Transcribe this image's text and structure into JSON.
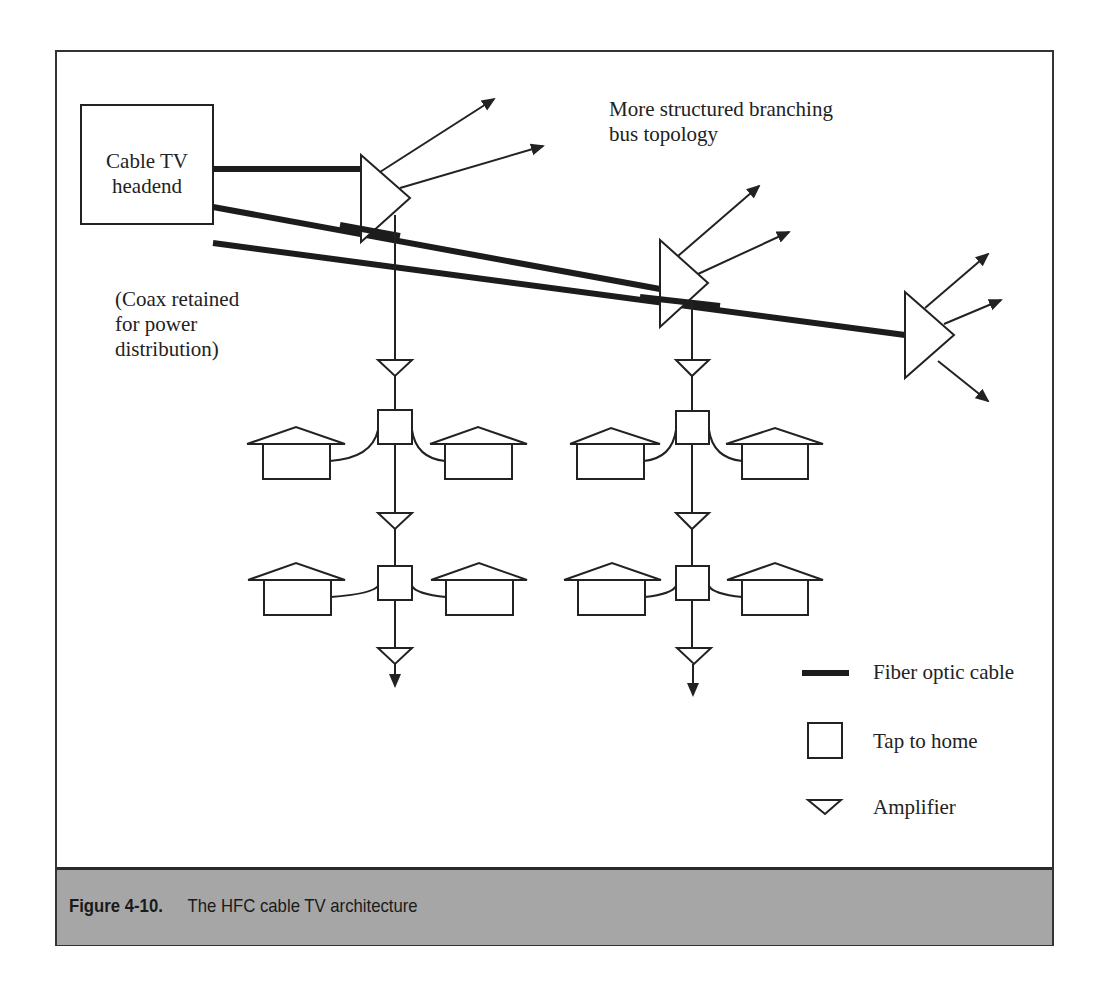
{
  "figure": {
    "caption_number": "Figure 4-10.",
    "caption_title": "The HFC cable TV architecture"
  },
  "labels": {
    "headend_line1": "Cable TV",
    "headend_line2": "headend",
    "coax_note_line1": "(Coax retained",
    "coax_note_line2": "for power",
    "coax_note_line3": "distribution)",
    "topology_line1": "More structured branching",
    "topology_line2": "bus topology"
  },
  "legend": {
    "items": [
      {
        "icon": "fiber-line-icon",
        "label": "Fiber optic cable"
      },
      {
        "icon": "tap-square-icon",
        "label": "Tap to home"
      },
      {
        "icon": "amplifier-triangle-icon",
        "label": "Amplifier"
      }
    ]
  },
  "colors": {
    "stroke": "#222222",
    "caption_bg": "#a6a6a6",
    "frame": "#333333"
  }
}
